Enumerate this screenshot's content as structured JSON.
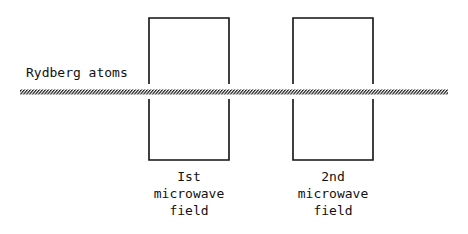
{
  "diagram": {
    "beam_label": "Rydberg atoms",
    "fields": [
      {
        "label_lines": [
          "Ist",
          "microwave",
          "field"
        ]
      },
      {
        "label_lines": [
          "2nd",
          "microwave",
          "field"
        ]
      }
    ],
    "colors": {
      "line": "#111111",
      "background": "#ffffff"
    }
  }
}
